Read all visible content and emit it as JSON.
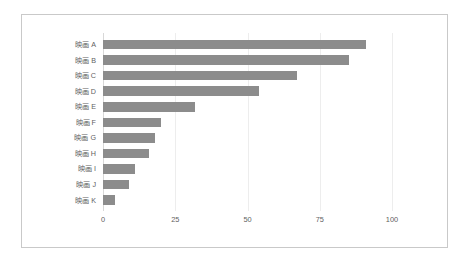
{
  "chart_data": {
    "type": "bar",
    "orientation": "horizontal",
    "title": "",
    "xlabel": "",
    "ylabel": "",
    "categories": [
      "映画 A",
      "映画 B",
      "映画 C",
      "映画 D",
      "映画 E",
      "映画 F",
      "映画 G",
      "映画 H",
      "映画 I",
      "映画 J",
      "映画 K"
    ],
    "values": [
      91,
      85,
      67,
      54,
      32,
      20,
      18,
      16,
      11,
      9,
      4
    ],
    "series": [
      {
        "name": "",
        "values": [
          91,
          85,
          67,
          54,
          32,
          20,
          18,
          16,
          11,
          9,
          4
        ]
      }
    ],
    "xlim": [
      0,
      100
    ],
    "xticks": [
      0,
      25,
      50,
      75,
      100
    ],
    "xtick_labels": [
      "0",
      "25",
      "50",
      "75",
      "100"
    ],
    "grid": "vertical-faint",
    "legend": "none",
    "bar_color": "#8c8c8c",
    "grid_color": "#ededed",
    "axis_color": "#d8d8d8",
    "border_color": "#c9c9c9",
    "background_color": "#ffffff",
    "label_color": "#5f5f5f"
  }
}
